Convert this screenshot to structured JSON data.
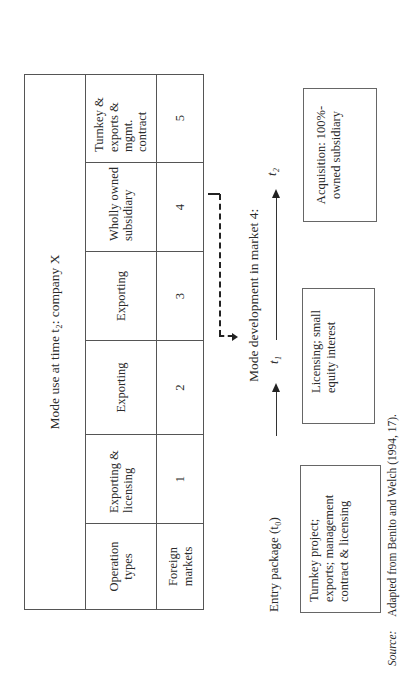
{
  "table": {
    "title": "Mode use at time t₂: company X",
    "row_headers": {
      "operation_types": "Operation types",
      "foreign_markets": "Foreign markets"
    },
    "columns": [
      {
        "operation": "Exporting & licensing",
        "market": "1"
      },
      {
        "operation": "Exporting",
        "market": "2"
      },
      {
        "operation": "Exporting",
        "market": "3"
      },
      {
        "operation": "Wholly owned subsidiary",
        "market": "4"
      },
      {
        "operation": "Turnkey & exports & mgmt. contract",
        "market": "5"
      }
    ]
  },
  "diagram": {
    "heading": "Mode development in market 4:",
    "entry_label": "Entry package (t₀)",
    "t1_label": "t₁",
    "t2_label": "t₂",
    "boxes": {
      "entry": "Turnkey project; exports; management contract & licensing",
      "t1": "Licensing; small equity interest",
      "t2": "Acquisition: 100%-owned subsidiary"
    }
  },
  "source": {
    "label": "Source:",
    "text": "Adapted from Benito and Welch (1994, 17)."
  }
}
